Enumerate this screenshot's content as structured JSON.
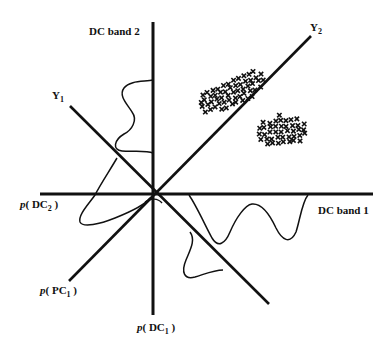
{
  "diagram": {
    "axes": {
      "dc_band_1": {
        "label": "DC band 1"
      },
      "dc_band_2": {
        "label": "DC band 2"
      },
      "y1": {
        "label_main": "Y",
        "label_sub": "1"
      },
      "y2": {
        "label_main": "Y",
        "label_sub": "2"
      }
    },
    "distribution_labels": {
      "p_dc2": {
        "prefix": "p",
        "open": "( DC",
        "sub": "2",
        "close": " )"
      },
      "p_pc1": {
        "prefix": "p",
        "open": "( PC",
        "sub": "1",
        "close": " )"
      },
      "p_dc1": {
        "prefix": "p",
        "open": "( DC",
        "sub": "1",
        "close": " )"
      }
    },
    "clusters": [
      {
        "name": "cluster-upper",
        "marker": "x",
        "description": "elongated cluster along Y2 axis"
      },
      {
        "name": "cluster-lower",
        "marker": "x",
        "description": "cluster below Y2 axis"
      }
    ],
    "colors": {
      "ink": "#111111",
      "background": "#ffffff"
    }
  }
}
